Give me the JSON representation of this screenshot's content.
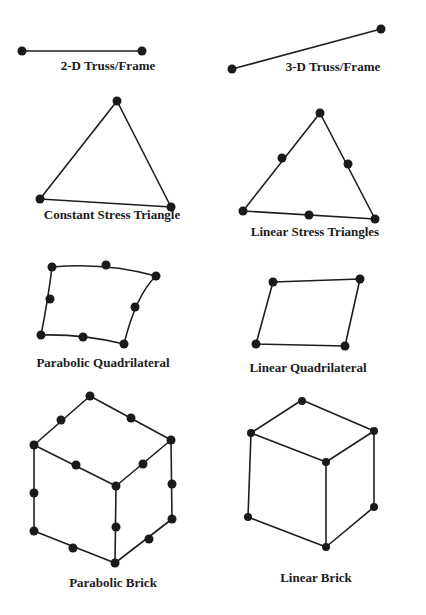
{
  "style": {
    "line_color": "#1e1e1e",
    "node_color": "#1a1a1a",
    "label_color": "#1c1c1c",
    "background": "#ffffff"
  },
  "elements": [
    {
      "id": "truss2d",
      "label": "2-D Truss/Frame",
      "label_pos": [
        108,
        58
      ]
    },
    {
      "id": "truss3d",
      "label": "3-D Truss/Frame",
      "label_pos": [
        333,
        59
      ]
    },
    {
      "id": "cst",
      "label": "Constant Stress Triangle",
      "label_pos": [
        112,
        207
      ]
    },
    {
      "id": "lst",
      "label": "Linear Stress Triangles",
      "label_pos": [
        315,
        224
      ]
    },
    {
      "id": "pquad",
      "label": "Parabolic Quadrilateral",
      "label_pos": [
        103,
        355
      ]
    },
    {
      "id": "lquad",
      "label": "Linear Quadrilateral",
      "label_pos": [
        308,
        360
      ]
    },
    {
      "id": "pbrick",
      "label": "Parabolic Brick",
      "label_pos": [
        113,
        575
      ]
    },
    {
      "id": "lbrick",
      "label": "Linear Brick",
      "label_pos": [
        316,
        570
      ]
    }
  ]
}
